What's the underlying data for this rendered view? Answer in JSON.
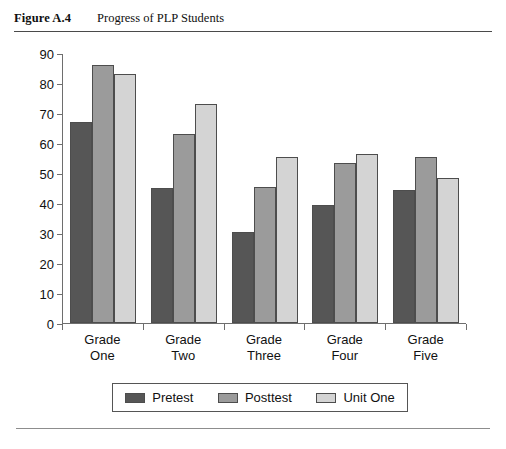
{
  "figure": {
    "number": "Figure A.4",
    "title": "Progress of PLP Students"
  },
  "chart_data": {
    "type": "bar",
    "title": "Progress of PLP Students",
    "xlabel": "",
    "ylabel": "",
    "ylim": [
      0,
      90
    ],
    "y_ticks": [
      0,
      10,
      20,
      30,
      40,
      50,
      60,
      70,
      80,
      90
    ],
    "grid": false,
    "legend_position": "bottom",
    "categories": [
      "Grade One",
      "Grade Two",
      "Grade Three",
      "Grade Four",
      "Grade Five"
    ],
    "category_lines": [
      [
        "Grade",
        "One"
      ],
      [
        "Grade",
        "Two"
      ],
      [
        "Grade",
        "Three"
      ],
      [
        "Grade",
        "Four"
      ],
      [
        "Grade",
        "Five"
      ]
    ],
    "series": [
      {
        "name": "Pretest",
        "color": "#565656",
        "values": [
          67,
          45,
          30.3,
          39.5,
          44.5
        ]
      },
      {
        "name": "Posttest",
        "color": "#9b9b9b",
        "values": [
          86,
          63,
          45.3,
          53.5,
          55.5
        ]
      },
      {
        "name": "Unit One",
        "color": "#d4d4d4",
        "values": [
          83,
          73,
          55.5,
          56.5,
          48.5
        ]
      }
    ]
  },
  "legend": {
    "entries": [
      {
        "label": "Pretest"
      },
      {
        "label": "Posttest"
      },
      {
        "label": "Unit One"
      }
    ]
  }
}
